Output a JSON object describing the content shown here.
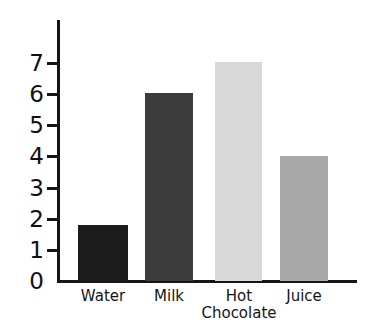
{
  "chart_data": {
    "type": "bar",
    "title": "",
    "xlabel": "",
    "ylabel": "",
    "categories": [
      "Water",
      "Milk",
      "Hot Chocolate",
      "Juice"
    ],
    "values": [
      1.8,
      6,
      7,
      4
    ],
    "ylim": [
      0,
      7.5
    ],
    "yticks": [
      0,
      1,
      2,
      3,
      4,
      5,
      6,
      7
    ],
    "ytick_labels": [
      "0",
      "1",
      "2",
      "3",
      "4",
      "5",
      "6",
      "7"
    ],
    "grid": false,
    "legend": "none",
    "bar_colors": [
      "#1c1c1c",
      "#3b3b3b",
      "#d9d9d9",
      "#a9a9a9"
    ],
    "axis_color": "#151515",
    "background": "#ffffff",
    "bars": [
      {
        "label": "Water",
        "label_line1": "Water",
        "label_line2": "",
        "value": 1.8,
        "color": "#1c1c1c"
      },
      {
        "label": "Milk",
        "label_line1": "Milk",
        "label_line2": "",
        "value": 6,
        "color": "#3b3b3b"
      },
      {
        "label": "Hot Chocolate",
        "label_line1": "Hot",
        "label_line2": "Chocolate",
        "value": 7,
        "color": "#d9d9d9"
      },
      {
        "label": "Juice",
        "label_line1": "Juice",
        "label_line2": "",
        "value": 4,
        "color": "#a9a9a9"
      }
    ]
  }
}
